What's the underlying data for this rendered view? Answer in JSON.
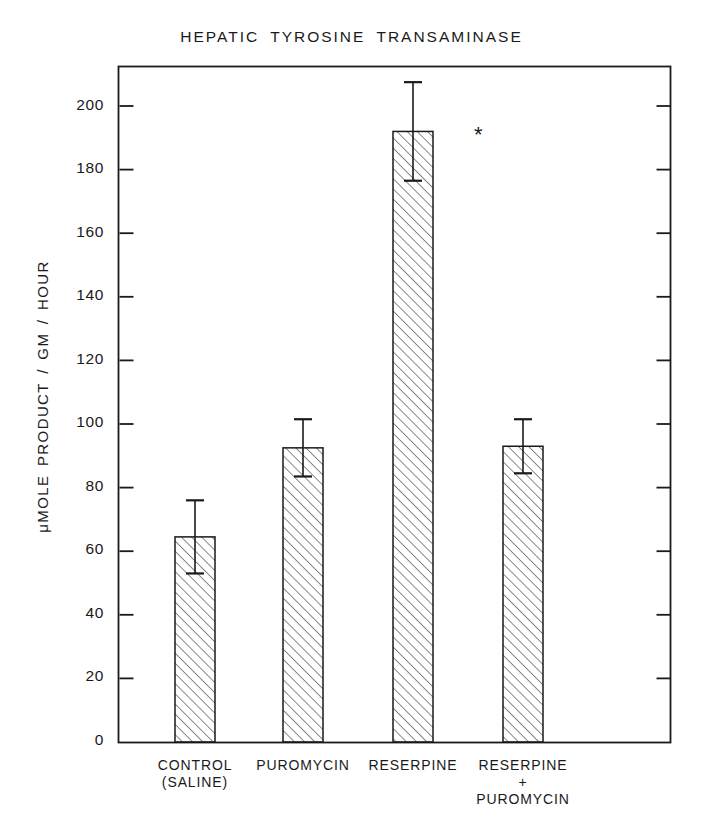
{
  "chart_data": {
    "type": "bar",
    "title": "HEPATIC TYROSINE TRANSAMINASE",
    "xlabel": "",
    "ylabel": "μMOLE  PRODUCT / GM / HOUR",
    "categories": [
      "CONTROL\n(SALINE)",
      "PUROMYCIN",
      "RESERPINE",
      "RESERPINE\n+\nPUROMYCIN"
    ],
    "values": [
      64.5,
      92.5,
      192.0,
      93.0
    ],
    "errors": [
      11.5,
      9.0,
      15.5,
      8.5
    ],
    "error_type": "symmetric",
    "annotations": [
      {
        "category": "RESERPINE",
        "text": "*",
        "meaning": "significance-marker"
      }
    ],
    "ylim": [
      0,
      212
    ],
    "yticks": [
      0,
      20,
      40,
      60,
      80,
      100,
      120,
      140,
      160,
      180,
      200
    ],
    "ytick_labels": [
      "0",
      "20",
      "40",
      "60",
      "80",
      "100",
      "120",
      "140",
      "160",
      "180",
      "200"
    ],
    "grid": false,
    "legend": false,
    "bar_fill": "diagonal-hatch",
    "colors": {
      "axis": "#1a1a1a",
      "bar_edge": "#1a1a1a",
      "hatch": "#2a2a2a",
      "background": "#ffffff"
    }
  }
}
